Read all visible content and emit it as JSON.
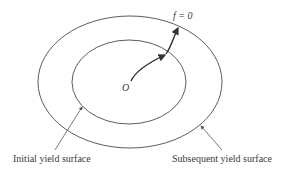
{
  "diagram": {
    "labels": {
      "origin": "O",
      "yield_function": "f = 0",
      "initial_surface": "Initial yield surface",
      "subsequent_surface": "Subsequent yield surface"
    },
    "colors": {
      "stroke": "#4a4a4a",
      "text": "#3a3a3a",
      "background": "#ffffff"
    }
  }
}
